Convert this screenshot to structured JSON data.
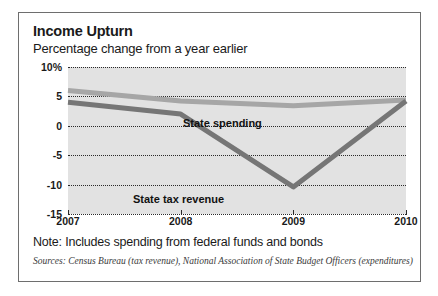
{
  "figure": {
    "title": "Income Upturn",
    "subtitle": "Percentage change from a year earlier",
    "note": "Note: Includes spending from federal funds and bonds",
    "sources": "Sources: Census Bureau (tax revenue), National Association of State Budget Officers (expenditures)"
  },
  "colors": {
    "plot_background": "#e2e2e2",
    "border": "#6e6e6e",
    "gridline": "#2a2a2a",
    "state_spending": "#a6a6a6",
    "state_tax_revenue": "#767676",
    "text": "#1a1a1a"
  },
  "chart_data": {
    "type": "line",
    "title": "Income Upturn",
    "subtitle": "Percentage change from a year earlier",
    "xlabel": "",
    "ylabel": "",
    "x": [
      2007,
      2008,
      2009,
      2010
    ],
    "categories": [
      "2007",
      "2008",
      "2009",
      "2010"
    ],
    "xtick_labels": [
      "2007",
      "2008",
      "2009",
      "2010"
    ],
    "ytick_labels": [
      "10%",
      "5",
      "0",
      "-5",
      "-10",
      "-15"
    ],
    "ytick_values": [
      10,
      5,
      0,
      -5,
      -10,
      -15
    ],
    "ylim": [
      -15,
      10
    ],
    "grid": true,
    "grid_style": "dotted-horizontal",
    "legend": "inline-labels",
    "series": [
      {
        "name": "State spending",
        "label": "State spending",
        "color": "#a6a6a6",
        "values": [
          6.0,
          4.2,
          3.4,
          4.4
        ]
      },
      {
        "name": "State tax revenue",
        "label": "State tax revenue",
        "color": "#767676",
        "values": [
          4.0,
          2.0,
          -10.4,
          4.2
        ]
      }
    ],
    "note": "Note: Includes spending from federal funds and bonds",
    "sources": "Sources: Census Bureau (tax revenue), National Association of State Budget Officers (expenditures)"
  }
}
